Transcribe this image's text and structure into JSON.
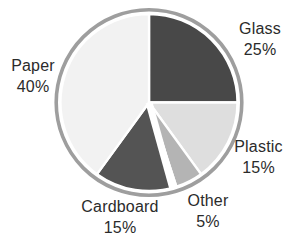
{
  "figure": {
    "background_color": "#ffffff",
    "text_color": "#2b2b2b"
  },
  "chart_data": {
    "type": "pie",
    "title": "",
    "start_angle_deg": 0,
    "direction": "clockwise",
    "label_style": "outside-callouts",
    "legend": "none",
    "rim_color": "#9e9e9e",
    "border_color": "#ffffff",
    "slices": [
      {
        "label": "Glass",
        "value": 25,
        "pct_text": "25%",
        "color": "#484848"
      },
      {
        "label": "Plastic",
        "value": 15,
        "pct_text": "15%",
        "color": "#dedede"
      },
      {
        "label": "Other",
        "value": 5,
        "pct_text": "5%",
        "color": "#b4b4b4"
      },
      {
        "label": "Cardboard",
        "value": 15,
        "pct_text": "15%",
        "color": "#545454"
      },
      {
        "label": "Paper",
        "value": 40,
        "pct_text": "40%",
        "color": "#f2f2f2"
      }
    ]
  }
}
